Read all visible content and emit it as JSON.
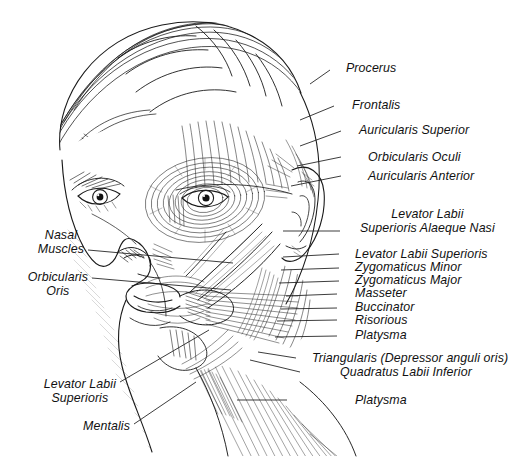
{
  "figure": {
    "style": "pen-and-ink anatomical line drawing",
    "background_color": "#ffffff",
    "ink_color": "#1a1a1a",
    "label_color": "#111111",
    "width": 522,
    "height": 470
  },
  "labels_right": [
    {
      "id": "procerus",
      "text": "Procerus",
      "x": 346,
      "y": 62,
      "lx1": 330,
      "ly1": 70,
      "lx2": 310,
      "ly2": 84
    },
    {
      "id": "frontalis",
      "text": "Frontalis",
      "x": 352,
      "y": 99,
      "lx1": 334,
      "ly1": 106,
      "lx2": 300,
      "ly2": 120
    },
    {
      "id": "auricularis-superior",
      "text": "Auricularis Superior",
      "x": 359,
      "y": 124,
      "lx1": 341,
      "ly1": 131,
      "lx2": 300,
      "ly2": 146
    },
    {
      "id": "orbicularis-oculi",
      "text": "Orbicularis Oculi",
      "x": 368,
      "y": 151,
      "lx1": 341,
      "ly1": 157,
      "lx2": 297,
      "ly2": 166
    },
    {
      "id": "auricularis-anterior",
      "text": "Auricularis Anterior",
      "x": 368,
      "y": 170,
      "lx1": 341,
      "ly1": 176,
      "lx2": 291,
      "ly2": 186
    },
    {
      "id": "levator-labii-alaeque-nasi",
      "text": "Levator Labii\nSuperioris Alaeque Nasi",
      "x": 360,
      "y": 208,
      "lx1": 340,
      "ly1": 231,
      "lx2": 283,
      "ly2": 231
    },
    {
      "id": "levator-labii-superioris-r",
      "text": "Levator Labii Superioris",
      "x": 355,
      "y": 248,
      "lx1": 339,
      "ly1": 254,
      "lx2": 283,
      "ly2": 257
    },
    {
      "id": "zygomaticus-minor",
      "text": "Zygomaticus Minor",
      "x": 355,
      "y": 261,
      "lx1": 339,
      "ly1": 268,
      "lx2": 281,
      "ly2": 270
    },
    {
      "id": "zygomaticus-major",
      "text": "Zygomaticus Major",
      "x": 355,
      "y": 274,
      "lx1": 339,
      "ly1": 281,
      "lx2": 279,
      "ly2": 283
    },
    {
      "id": "masseter",
      "text": "Masseter",
      "x": 355,
      "y": 287,
      "lx1": 337,
      "ly1": 294,
      "lx2": 286,
      "ly2": 296
    },
    {
      "id": "buccinator",
      "text": "Buccinator",
      "x": 355,
      "y": 301,
      "lx1": 337,
      "ly1": 308,
      "lx2": 281,
      "ly2": 309
    },
    {
      "id": "risorious",
      "text": "Risorious",
      "x": 355,
      "y": 314,
      "lx1": 337,
      "ly1": 320,
      "lx2": 277,
      "ly2": 321
    },
    {
      "id": "platysma-upper",
      "text": "Platysma",
      "x": 355,
      "y": 329,
      "lx1": 337,
      "ly1": 336,
      "lx2": 275,
      "ly2": 337
    },
    {
      "id": "triangularis",
      "text": "Triangularis (Depressor anguli oris)",
      "x": 312,
      "y": 352,
      "lx1": 296,
      "ly1": 358,
      "lx2": 258,
      "ly2": 352
    },
    {
      "id": "quadratus-labii-inferior",
      "text": "Quadratus Labii Inferior",
      "x": 340,
      "y": 366,
      "lx1": 300,
      "ly1": 372,
      "lx2": 250,
      "ly2": 360
    },
    {
      "id": "platysma-lower",
      "text": "Platysma",
      "x": 355,
      "y": 394,
      "lx1": 287,
      "ly1": 400,
      "lx2": 237,
      "ly2": 400
    }
  ],
  "labels_left": [
    {
      "id": "nasal-muscles",
      "text": "Nasal\nMuscles",
      "x": 84,
      "y": 229,
      "lx1": 88,
      "ly1": 250,
      "lx2": 233,
      "ly2": 263
    },
    {
      "id": "orbicularis-oris",
      "text": "Orbicularis\nOris",
      "x": 88,
      "y": 271,
      "lx1": 92,
      "ly1": 278,
      "lx2": 231,
      "ly2": 290
    },
    {
      "id": "levator-labii-superioris-l",
      "text": "Levator Labii\nSuperioris",
      "x": 116,
      "y": 378,
      "lx1": 120,
      "ly1": 382,
      "lx2": 209,
      "ly2": 330
    },
    {
      "id": "mentalis",
      "text": "Mentalis",
      "x": 130,
      "y": 420,
      "lx1": 134,
      "ly1": 424,
      "lx2": 196,
      "ly2": 382
    }
  ],
  "caption": {
    "text": "",
    "note": "cropped at bottom edge, illegible"
  }
}
